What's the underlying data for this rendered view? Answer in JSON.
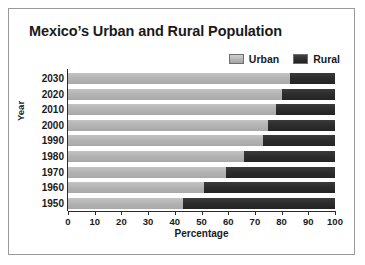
{
  "chart_data": {
    "type": "bar",
    "orientation": "horizontal",
    "stacked": true,
    "title": "Mexico’s Urban and Rural Population",
    "xlabel": "Percentage",
    "ylabel": "Year",
    "categories": [
      "2030",
      "2020",
      "2010",
      "2000",
      "1990",
      "1980",
      "1970",
      "1960",
      "1950"
    ],
    "series": [
      {
        "name": "Urban",
        "color": "#b4b4b4",
        "values": [
          83,
          80,
          78,
          75,
          73,
          66,
          59,
          51,
          43
        ]
      },
      {
        "name": "Rural",
        "color": "#2d2d2d",
        "values": [
          17,
          20,
          22,
          25,
          27,
          34,
          41,
          49,
          57
        ]
      }
    ],
    "xlim": [
      0,
      100
    ],
    "xticks": [
      0,
      10,
      20,
      30,
      40,
      50,
      60,
      70,
      80,
      90,
      100
    ],
    "xtick_labels": [
      "0",
      "10",
      "20",
      "30",
      "40",
      "50",
      "60",
      "70",
      "80",
      "90",
      "100"
    ],
    "grid": false,
    "legend_position": "top-right"
  }
}
